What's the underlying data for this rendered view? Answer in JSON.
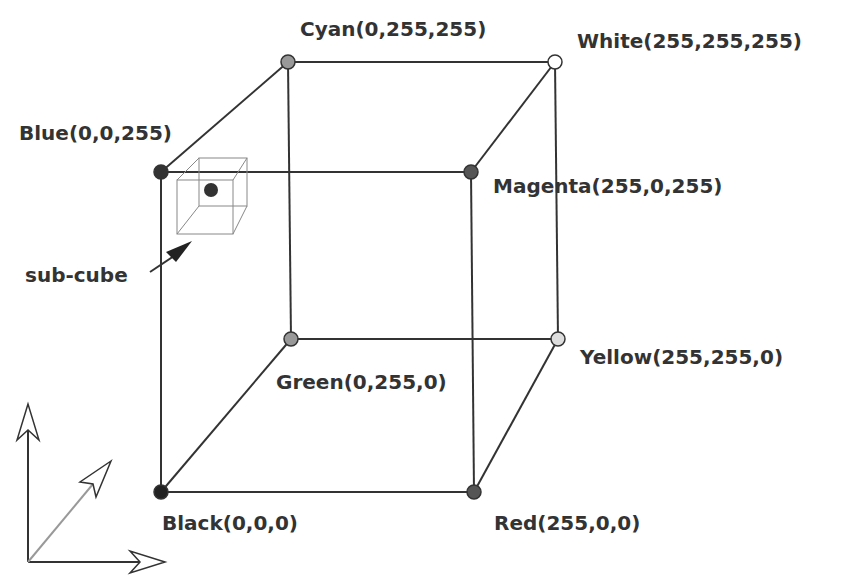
{
  "diagram": {
    "type": "rgb-color-cube",
    "vertices": [
      {
        "id": "black",
        "label": "Black(0,0,0)",
        "x": 161,
        "y": 492,
        "fill": "#222222",
        "lx": 162,
        "ly": 530
      },
      {
        "id": "red",
        "label": "Red(255,0,0)",
        "x": 474,
        "y": 492,
        "fill": "#555555",
        "lx": 494,
        "ly": 530
      },
      {
        "id": "green",
        "label": "Green(0,255,0)",
        "x": 291,
        "y": 339,
        "fill": "#999999",
        "lx": 276,
        "ly": 389
      },
      {
        "id": "yellow",
        "label": "Yellow(255,255,0)",
        "x": 558,
        "y": 339,
        "fill": "#dddddd",
        "lx": 580,
        "ly": 364
      },
      {
        "id": "blue",
        "label": "Blue(0,0,255)",
        "x": 161,
        "y": 172,
        "fill": "#333333",
        "lx": 19,
        "ly": 140
      },
      {
        "id": "magenta",
        "label": "Magenta(255,0,255)",
        "x": 471,
        "y": 172,
        "fill": "#555555",
        "lx": 493,
        "ly": 193
      },
      {
        "id": "cyan",
        "label": "Cyan(0,255,255)",
        "x": 288,
        "y": 62,
        "fill": "#999999",
        "lx": 300,
        "ly": 36
      },
      {
        "id": "white",
        "label": "White(255,255,255)",
        "x": 555,
        "y": 62,
        "fill": "#ffffff",
        "lx": 577,
        "ly": 48
      }
    ],
    "edges": [
      [
        "black",
        "red"
      ],
      [
        "black",
        "green"
      ],
      [
        "black",
        "blue"
      ],
      [
        "red",
        "yellow"
      ],
      [
        "red",
        "magenta"
      ],
      [
        "green",
        "yellow"
      ],
      [
        "green",
        "cyan"
      ],
      [
        "blue",
        "magenta"
      ],
      [
        "blue",
        "cyan"
      ],
      [
        "magenta",
        "white"
      ],
      [
        "yellow",
        "white"
      ],
      [
        "cyan",
        "white"
      ]
    ],
    "subcube": {
      "label": "sub-cube",
      "lx": 25,
      "ly": 282
    },
    "axes": {
      "description": "3D coordinate axes indicator (up, right, diagonal)"
    },
    "colors": {
      "line": "#333333",
      "text": "#333333",
      "subcube_line": "#888888",
      "axis_diag": "#999999"
    }
  }
}
